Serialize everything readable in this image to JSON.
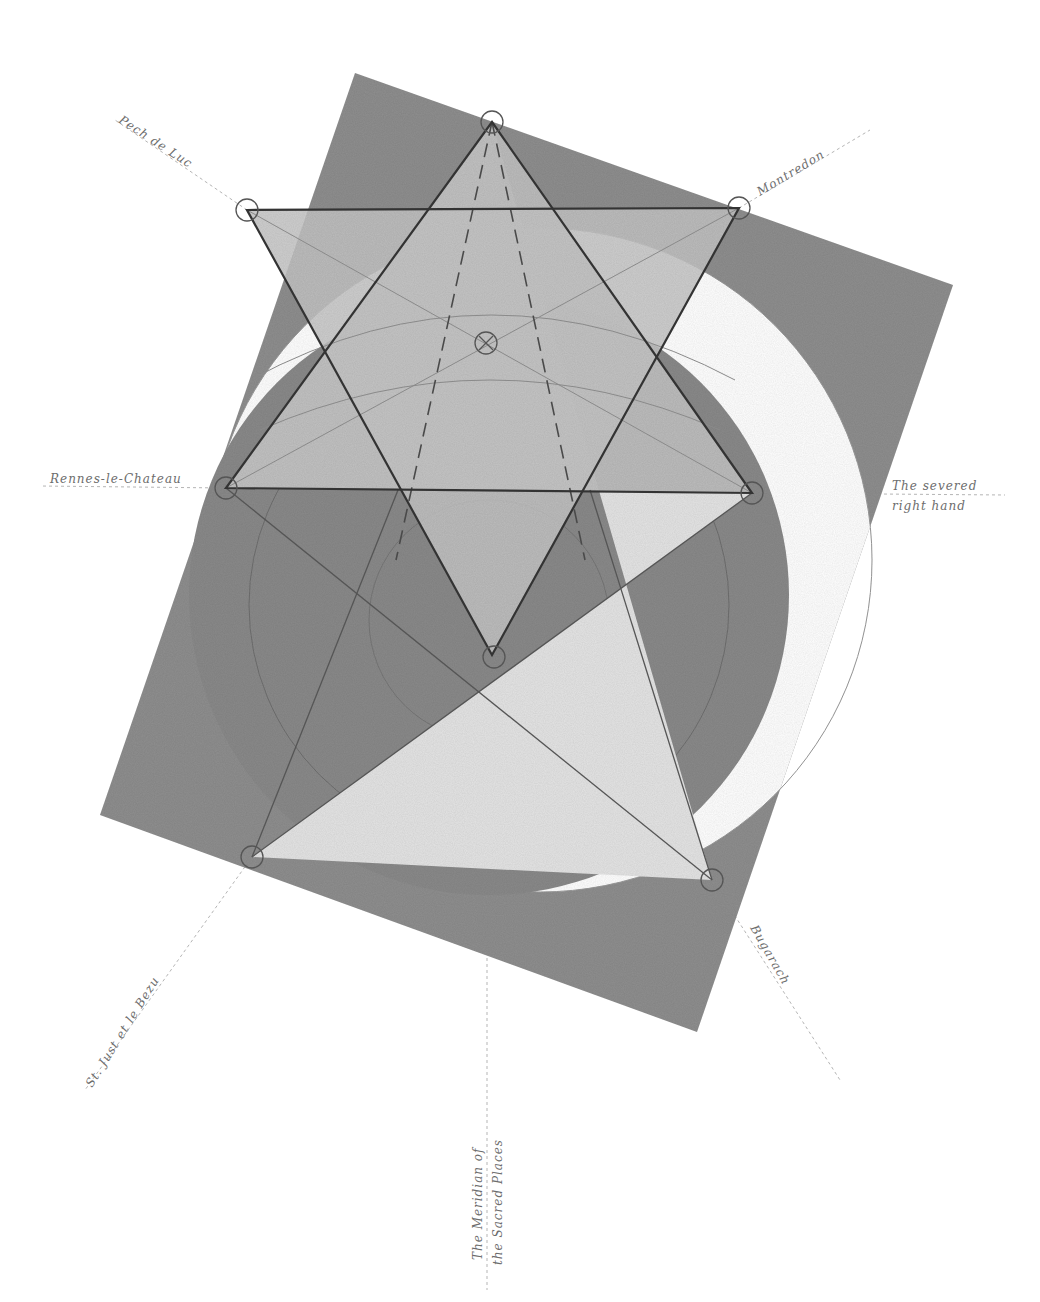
{
  "diagram": {
    "colors": {
      "background": "#ffffff",
      "square_fill": "#8f8f8f",
      "dark_circle_fill": "#8a8a8a",
      "hexagram_fill": "#bdbdbd",
      "pentagram_fill": "#e3e3e3",
      "line": "#3d3d3d",
      "faint_line": "#a0a0a0",
      "label": "#6d6d6d"
    },
    "labels": {
      "pech_de_luc": "Pech de Luc",
      "montredon": "Montredon",
      "rennes_le_chateau": "Rennes-le-Chateau",
      "severed_hand_line1": "The severed",
      "severed_hand_line2": "right hand",
      "st_just": "St. Just et le Bezu",
      "bugarach": "Bugarach",
      "meridian_line1": "The Meridian of",
      "meridian_line2": "the Sacred Places"
    },
    "points": {
      "hexagram_top": [
        492,
        122
      ],
      "pech_de_luc": [
        247,
        210
      ],
      "montredon": [
        739,
        208
      ],
      "rennes_le_chateau": [
        226,
        488
      ],
      "severed_hand": [
        752,
        493
      ],
      "hexagram_bottom": [
        492,
        655
      ],
      "st_just": [
        252,
        857
      ],
      "bugarach": [
        712,
        880
      ],
      "center_mark": [
        486,
        343
      ]
    }
  }
}
